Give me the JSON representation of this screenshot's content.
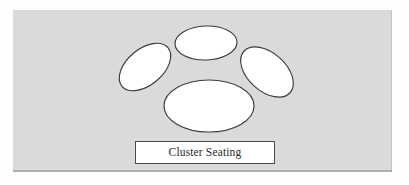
{
  "diagram": {
    "title": "Cluster Seating",
    "panel": {
      "background_color": "#dadada",
      "x": 13,
      "y": 10,
      "width": 379,
      "height": 162
    },
    "caption": {
      "label": "Cluster Seating",
      "box_fill": "#ffffff",
      "box_border_color": "#4a4a4a",
      "text_color": "#2b2b2b"
    },
    "shape_style": {
      "fill": "#ffffff",
      "stroke": "#3b3b3b",
      "stroke_width": 1.15
    },
    "tables": [
      {
        "name": "table-top-center",
        "shape": "ellipse",
        "cx": 193,
        "cy": 33,
        "rx": 31,
        "ry": 17,
        "rotation": -2
      },
      {
        "name": "table-left",
        "shape": "ellipse",
        "cx": 132,
        "cy": 57,
        "rx": 30,
        "ry": 18,
        "rotation": -40
      },
      {
        "name": "table-right",
        "shape": "ellipse",
        "cx": 254,
        "cy": 62,
        "rx": 31,
        "ry": 19,
        "rotation": 42
      },
      {
        "name": "table-bottom-center",
        "shape": "ellipse",
        "cx": 196,
        "cy": 96,
        "rx": 45,
        "ry": 26,
        "rotation": 0
      }
    ]
  }
}
